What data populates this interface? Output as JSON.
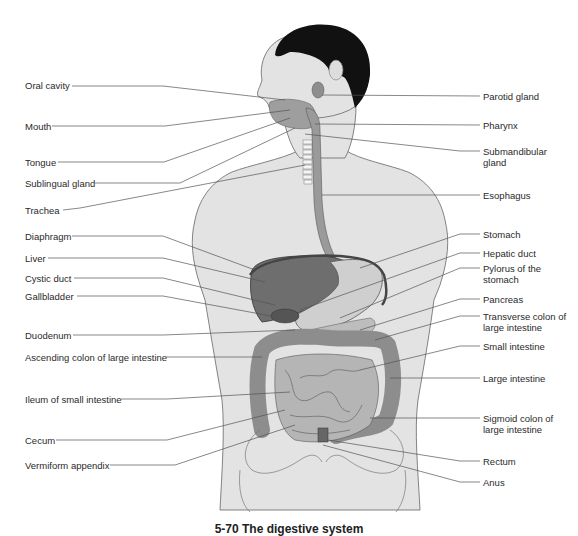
{
  "figure": {
    "title": "The digestive system",
    "caption": "5-70 The digestive system",
    "colors": {
      "skin": "#e3e3e3",
      "outline": "#555555",
      "hair": "#111111",
      "organ_dark": "#6e6e6e",
      "organ_mid": "#9a9a9a",
      "organ_light": "#c8c8c8",
      "leader_line": "#555555"
    }
  },
  "labels_left": [
    {
      "text": "Oral cavity"
    },
    {
      "text": "Mouth"
    },
    {
      "text": "Tongue"
    },
    {
      "text": "Sublingual gland"
    },
    {
      "text": "Trachea"
    },
    {
      "text": "Diaphragm"
    },
    {
      "text": "Liver"
    },
    {
      "text": "Cystic duct"
    },
    {
      "text": "Gallbladder"
    },
    {
      "text": "Duodenum"
    },
    {
      "text": "Ascending colon of large intestine"
    },
    {
      "text": "Ileum of small intestine"
    },
    {
      "text": "Cecum"
    },
    {
      "text": "Vermiform appendix"
    }
  ],
  "labels_right": [
    {
      "text": "Parotid gland"
    },
    {
      "text": "Pharynx"
    },
    {
      "text": "Submandibular gland"
    },
    {
      "text": "Esophagus"
    },
    {
      "text": "Stomach"
    },
    {
      "text": "Hepatic duct"
    },
    {
      "text": "Pylorus of the stomach"
    },
    {
      "text": "Pancreas"
    },
    {
      "text": "Transverse colon of large intestine"
    },
    {
      "text": "Small intestine"
    },
    {
      "text": "Large intestine"
    },
    {
      "text": "Sigmoid colon of large intestine"
    },
    {
      "text": "Rectum"
    },
    {
      "text": "Anus"
    }
  ]
}
